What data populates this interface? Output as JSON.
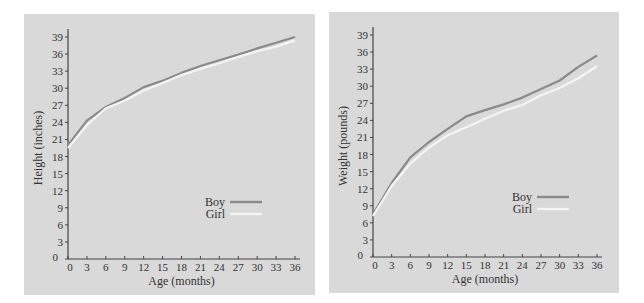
{
  "chart_data": [
    {
      "type": "line",
      "title": "",
      "xlabel": "Age (months)",
      "ylabel": "Height (inches)",
      "x": [
        0,
        3,
        6,
        9,
        12,
        15,
        18,
        21,
        24,
        27,
        30,
        33,
        36
      ],
      "xticks": [
        "0",
        "3",
        "6",
        "9",
        "12",
        "15",
        "18",
        "21",
        "24",
        "27",
        "30",
        "33",
        "36"
      ],
      "yticks": [
        "0",
        "3",
        "6",
        "9",
        "12",
        "15",
        "18",
        "21",
        "24",
        "27",
        "30",
        "33",
        "36",
        "39"
      ],
      "xlim": [
        0,
        36
      ],
      "ylim": [
        0,
        39
      ],
      "grid": false,
      "legend_position": "lower right",
      "series": [
        {
          "name": "Boy",
          "color": "#8a8a8a",
          "values": [
            20.0,
            24.3,
            26.7,
            28.3,
            30.2,
            31.3,
            32.7,
            33.9,
            34.9,
            35.9,
            37.0,
            38.0,
            39.0
          ]
        },
        {
          "name": "Girl",
          "color": "#f4f4f4",
          "values": [
            19.5,
            23.5,
            26.5,
            27.8,
            29.6,
            30.9,
            32.3,
            33.4,
            34.4,
            35.5,
            36.5,
            37.3,
            38.4
          ]
        }
      ]
    },
    {
      "type": "line",
      "title": "",
      "xlabel": "Age (months)",
      "ylabel": "Weight (pounds)",
      "x": [
        0,
        3,
        6,
        9,
        12,
        15,
        18,
        21,
        24,
        27,
        30,
        33,
        36
      ],
      "xticks": [
        "0",
        "3",
        "6",
        "9",
        "12",
        "15",
        "18",
        "21",
        "24",
        "27",
        "30",
        "33",
        "36"
      ],
      "yticks": [
        "0",
        "3",
        "6",
        "9",
        "12",
        "15",
        "18",
        "21",
        "24",
        "27",
        "30",
        "33",
        "36",
        "39"
      ],
      "xlim": [
        0,
        36
      ],
      "ylim": [
        0,
        39
      ],
      "grid": false,
      "legend_position": "lower right",
      "series": [
        {
          "name": "Boy",
          "color": "#8a8a8a",
          "values": [
            7.5,
            13.0,
            17.5,
            20.2,
            22.5,
            24.7,
            25.8,
            26.8,
            28.0,
            29.5,
            31.0,
            33.4,
            35.4
          ]
        },
        {
          "name": "Girl",
          "color": "#f4f4f4",
          "values": [
            7.2,
            12.5,
            16.4,
            19.2,
            21.4,
            22.8,
            24.3,
            25.7,
            26.7,
            28.4,
            29.7,
            31.4,
            33.5
          ]
        }
      ]
    }
  ],
  "colors": {
    "panel_background": "#d9d9d9",
    "axis": "#444444",
    "boy_line": "#8a8a8a",
    "girl_line": "#f4f4f4"
  }
}
